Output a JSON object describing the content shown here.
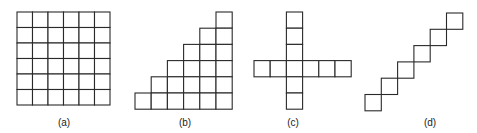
{
  "figures": [
    {
      "id": "a",
      "label": "(a)",
      "description": "6x6 full grid of squares",
      "cells": [
        [
          0,
          0
        ],
        [
          1,
          0
        ],
        [
          2,
          0
        ],
        [
          3,
          0
        ],
        [
          4,
          0
        ],
        [
          5,
          0
        ],
        [
          0,
          1
        ],
        [
          1,
          1
        ],
        [
          2,
          1
        ],
        [
          3,
          1
        ],
        [
          4,
          1
        ],
        [
          5,
          1
        ],
        [
          0,
          2
        ],
        [
          1,
          2
        ],
        [
          2,
          2
        ],
        [
          3,
          2
        ],
        [
          4,
          2
        ],
        [
          5,
          2
        ],
        [
          0,
          3
        ],
        [
          1,
          3
        ],
        [
          2,
          3
        ],
        [
          3,
          3
        ],
        [
          4,
          3
        ],
        [
          5,
          3
        ],
        [
          0,
          4
        ],
        [
          1,
          4
        ],
        [
          2,
          4
        ],
        [
          3,
          4
        ],
        [
          4,
          4
        ],
        [
          5,
          4
        ],
        [
          0,
          5
        ],
        [
          1,
          5
        ],
        [
          2,
          5
        ],
        [
          3,
          5
        ],
        [
          4,
          5
        ],
        [
          5,
          5
        ]
      ]
    },
    {
      "id": "b",
      "label": "(b)",
      "description": "staircase: columns of height 1 to 6, right-aligned",
      "cells": [
        [
          5,
          0
        ],
        [
          4,
          1
        ],
        [
          5,
          1
        ],
        [
          3,
          2
        ],
        [
          4,
          2
        ],
        [
          5,
          2
        ],
        [
          2,
          3
        ],
        [
          3,
          3
        ],
        [
          4,
          3
        ],
        [
          5,
          3
        ],
        [
          1,
          4
        ],
        [
          2,
          4
        ],
        [
          3,
          4
        ],
        [
          4,
          4
        ],
        [
          5,
          4
        ],
        [
          0,
          5
        ],
        [
          1,
          5
        ],
        [
          2,
          5
        ],
        [
          3,
          5
        ],
        [
          4,
          5
        ],
        [
          5,
          5
        ]
      ]
    },
    {
      "id": "c",
      "label": "(c)",
      "description": "cross shape",
      "cells": [
        [
          2,
          0
        ],
        [
          2,
          1
        ],
        [
          2,
          2
        ],
        [
          0,
          3
        ],
        [
          1,
          3
        ],
        [
          2,
          3
        ],
        [
          3,
          3
        ],
        [
          4,
          3
        ],
        [
          5,
          3
        ],
        [
          2,
          4
        ],
        [
          2,
          5
        ]
      ]
    },
    {
      "id": "d",
      "label": "(d)",
      "description": "diagonal chain of squares touching at corners",
      "cells": [
        [
          5,
          0
        ],
        [
          4,
          1
        ],
        [
          3,
          2
        ],
        [
          2,
          3
        ],
        [
          1,
          4
        ],
        [
          0,
          5
        ]
      ]
    }
  ]
}
